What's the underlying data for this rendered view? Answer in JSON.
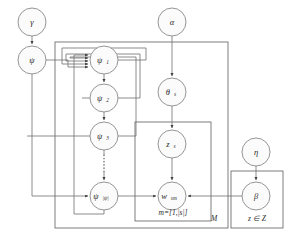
{
  "diagram": {
    "type": "bayesian-network-plate-diagram",
    "background_color": "#ffffff",
    "node_fill": "#fbfbfb",
    "node_stroke": "#8a8a8a",
    "edge_color": "#6f6f6f",
    "text_color": "#2b2b2b"
  },
  "nodes": {
    "gamma": {
      "label": "γ",
      "sub": "",
      "cx": 32,
      "cy": 22,
      "r": 14
    },
    "psi": {
      "label": "ψ",
      "sub": "",
      "cx": 32,
      "cy": 60,
      "r": 14
    },
    "alpha": {
      "label": "α",
      "sub": "",
      "cx": 172,
      "cy": 22,
      "r": 14
    },
    "psi1": {
      "label": "ψ",
      "sub": "1",
      "cx": 104,
      "cy": 60,
      "r": 14
    },
    "psi2": {
      "label": "ψ",
      "sub": "2",
      "cx": 104,
      "cy": 98,
      "r": 14
    },
    "psi3": {
      "label": "ψ",
      "sub": "3",
      "cx": 104,
      "cy": 136,
      "r": 14
    },
    "psiN": {
      "label": "ψ",
      "sub": "|ψ|",
      "cx": 104,
      "cy": 196,
      "r": 14
    },
    "theta": {
      "label": "θ",
      "sub": "s",
      "cx": 172,
      "cy": 92,
      "r": 14
    },
    "z": {
      "label": "z",
      "sub": "s",
      "cx": 172,
      "cy": 144,
      "r": 14
    },
    "w": {
      "label": "w",
      "sub": "sm",
      "cx": 172,
      "cy": 196,
      "r": 14
    },
    "eta": {
      "label": "η",
      "sub": "",
      "cx": 256,
      "cy": 152,
      "r": 14
    },
    "beta": {
      "label": "β",
      "sub": "",
      "cx": 256,
      "cy": 196,
      "r": 14
    }
  },
  "plates": [
    {
      "name": "outer-plate-M",
      "label": "M",
      "x": 55,
      "y": 42,
      "w": 173,
      "h": 186,
      "label_x": 214,
      "label_y": 219
    },
    {
      "name": "inner-plate-m",
      "label": "m=[1,|s|]",
      "x": 135,
      "y": 122,
      "w": 76,
      "h": 99,
      "label_x": 173,
      "label_y": 213
    },
    {
      "name": "plate-z-in-Z",
      "label": "z ∈ Z",
      "x": 231,
      "y": 171,
      "w": 52,
      "h": 57,
      "label_x": 257,
      "label_y": 219
    }
  ],
  "edges": [
    {
      "name": "gamma-to-psi",
      "from": "gamma",
      "to": "psi",
      "style": "straight-arrow"
    },
    {
      "name": "alpha-to-theta",
      "from": "alpha",
      "to": "theta",
      "style": "straight-arrow"
    },
    {
      "name": "theta-to-z",
      "from": "theta",
      "to": "z",
      "style": "straight-arrow"
    },
    {
      "name": "z-to-w",
      "from": "z",
      "to": "w",
      "style": "straight-arrow"
    },
    {
      "name": "psi1-to-psi2",
      "from": "psi1",
      "to": "psi2",
      "style": "straight-arrow"
    },
    {
      "name": "psi2-to-psi3",
      "from": "psi2",
      "to": "psi3",
      "style": "straight-arrow"
    },
    {
      "name": "psi3-to-psiN",
      "from": "psi3",
      "to": "psiN",
      "style": "dotted-arrow"
    },
    {
      "name": "psi-to-psi1",
      "from": "psi",
      "to": "psi1",
      "style": "routed-arrow"
    },
    {
      "name": "psi-to-psiN",
      "from": "psi",
      "to": "psiN",
      "style": "routed-arrow"
    },
    {
      "name": "psi1-feedback",
      "from": "psi1",
      "to": "psi1",
      "style": "feedback-loop"
    },
    {
      "name": "psi2-feedback",
      "from": "psi2",
      "to": "psi1",
      "style": "feedback-loop"
    },
    {
      "name": "psi3-feedback",
      "from": "psi3",
      "to": "psi1",
      "style": "feedback-loop"
    },
    {
      "name": "psiN-feedback",
      "from": "psiN",
      "to": "psi1",
      "style": "feedback-loop"
    },
    {
      "name": "psiN-to-w",
      "from": "psiN",
      "to": "w",
      "style": "straight-arrow"
    },
    {
      "name": "eta-to-beta",
      "from": "eta",
      "to": "beta",
      "style": "straight-arrow"
    },
    {
      "name": "beta-to-w",
      "from": "beta",
      "to": "w",
      "style": "straight-arrow"
    }
  ]
}
